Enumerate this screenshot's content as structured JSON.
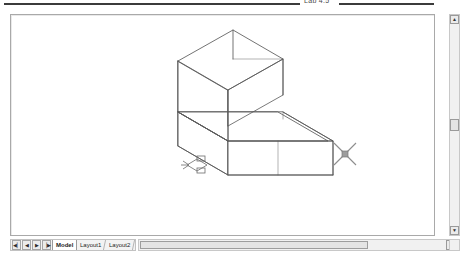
{
  "caption": {
    "text": "Lab 4.5"
  },
  "app": {
    "name": "autocad-drawing-window",
    "canvas_background": "#ffffff",
    "line_color": "#5a5a5a",
    "border_color": "#a9a9a9"
  },
  "canvas": {
    "ucs_icon": {
      "name": "ucs-icon",
      "x_label": "X",
      "y_label": "Y"
    },
    "cursor": {
      "name": "crosshair-pickbox-cursor",
      "x": 341,
      "y": 148,
      "arm_length": 14,
      "pickbox_size": 5
    },
    "model": {
      "name": "isometric-stepped-solid-wireframe",
      "description": "3D wireframe of an L-shaped stepped block in isometric view"
    }
  },
  "scrollbars": {
    "vertical": {
      "up_glyph": "▲",
      "down_glyph": "▼",
      "thumb_position_pct": 47
    },
    "horizontal": {
      "right_glyph": "◄",
      "thumb_width_pct": 72
    }
  },
  "tabs": {
    "nav_buttons": [
      {
        "name": "tab-first",
        "glyph": "◀▏"
      },
      {
        "name": "tab-prev",
        "glyph": "◀"
      },
      {
        "name": "tab-next",
        "glyph": "▶"
      },
      {
        "name": "tab-last",
        "glyph": "▕▶"
      }
    ],
    "items": [
      {
        "label": "Model",
        "active": true
      },
      {
        "label": "Layout1",
        "active": false
      },
      {
        "label": "Layout2",
        "active": false
      }
    ]
  }
}
